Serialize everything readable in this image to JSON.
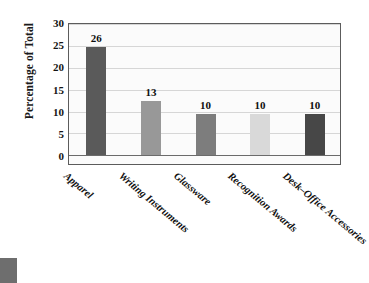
{
  "chart_data": {
    "type": "bar",
    "title": "",
    "xlabel": "",
    "ylabel": "Percentage of Total",
    "categories": [
      "Apparel",
      "Writing Instruments",
      "Glassware",
      "Recognition Awards",
      "Desk–Office Accessories"
    ],
    "values": [
      26,
      13,
      10,
      10,
      10
    ],
    "bar_labels": [
      "26",
      "13",
      "10",
      "10",
      "10"
    ],
    "bar_colors": [
      "#5a5a5a",
      "#989898",
      "#7d7d7d",
      "#d9d9d9",
      "#474747"
    ],
    "ylim": [
      0,
      32
    ],
    "yticks": [
      0,
      5,
      10,
      15,
      20,
      25,
      30
    ],
    "ytick_labels": [
      "0",
      "5",
      "10",
      "15",
      "20",
      "25",
      "30"
    ],
    "grid": true,
    "grid_axis": "y",
    "legend": false,
    "legend_position": "none",
    "frame": true
  },
  "figure": {
    "background_color": "#ffffff",
    "plot_background_color": "#fbfbfb",
    "frame_color": "#5c5c5c",
    "gridline_color": "#d6d6d6",
    "axis_color": "#6b6b6b",
    "text_color": "#111111",
    "corner_mark_color": "#6e6e6e"
  }
}
